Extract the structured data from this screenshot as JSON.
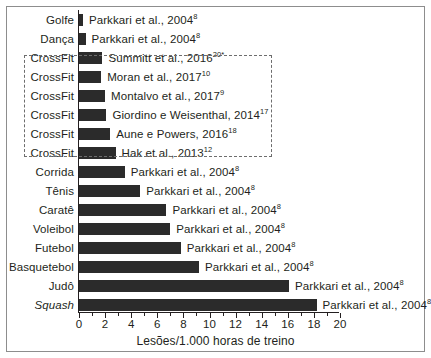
{
  "chart_data": {
    "type": "bar",
    "orientation": "horizontal",
    "title": "",
    "xlabel": "Lesões/1.000 horas de treino",
    "ylabel": "",
    "xlim": [
      0,
      20
    ],
    "xticks": [
      0,
      2,
      4,
      6,
      8,
      10,
      12,
      14,
      16,
      18,
      20
    ],
    "xtick_labels": [
      "0",
      "2",
      "4",
      "6",
      "8",
      "10",
      "12",
      "14",
      "16",
      "18",
      "20"
    ],
    "minor_tick_step": 1,
    "grid": false,
    "legend": null,
    "bar_color": "#2b2b2b",
    "categories": [
      "Golfe",
      "Dança",
      "CrossFit",
      "CrossFit",
      "CrossFit",
      "CrossFit",
      "CrossFit",
      "CrossFit",
      "Corrida",
      "Tênis",
      "Caratê",
      "Voleibol",
      "Futebol",
      "Basquetebol",
      "Judô",
      "Squash"
    ],
    "values": [
      0.3,
      0.5,
      1.8,
      1.7,
      2.0,
      2.1,
      2.4,
      2.8,
      3.5,
      4.7,
      6.7,
      7.0,
      7.8,
      9.2,
      16.1,
      18.2
    ],
    "annotations": [
      "Parkkari et al., 2004",
      "Parkkari et al., 2004",
      "Summitt et al., 2016",
      "Moran et al., 2017",
      "Montalvo et al., 2017",
      "Giordino e Weisenthal, 2014",
      "Aune e Powers, 2016",
      "Hak et al., 2013",
      "Parkkari et al., 2004",
      "Parkkari et al., 2004",
      "Parkkari et al., 2004",
      "Parkkari et al., 2004",
      "Parkkari et al., 2004",
      "Parkkari et al., 2004",
      "Parkkari et al., 2004",
      "Parkkari et al., 2004"
    ],
    "annotation_refs": [
      "8",
      "8",
      "20*",
      "10",
      "9",
      "17",
      "18",
      "12",
      "8",
      "8",
      "8",
      "8",
      "8",
      "8",
      "8",
      "8"
    ]
  },
  "rows": [
    {
      "category": "Golfe",
      "italic": false,
      "value": 0.3,
      "source": "Parkkari et al., 2004",
      "ref": "8",
      "highlighted": false
    },
    {
      "category": "Dança",
      "italic": false,
      "value": 0.5,
      "source": "Parkkari et al., 2004",
      "ref": "8",
      "highlighted": false
    },
    {
      "category": "CrossFit",
      "italic": false,
      "value": 1.8,
      "source": "Summitt et al., 2016",
      "ref": "20*",
      "highlighted": true
    },
    {
      "category": "CrossFit",
      "italic": false,
      "value": 1.7,
      "source": "Moran et al., 2017",
      "ref": "10",
      "highlighted": true
    },
    {
      "category": "CrossFit",
      "italic": false,
      "value": 2.0,
      "source": "Montalvo et al., 2017",
      "ref": "9",
      "highlighted": true
    },
    {
      "category": "CrossFit",
      "italic": false,
      "value": 2.1,
      "source": "Giordino e Weisenthal, 2014",
      "ref": "17",
      "highlighted": true
    },
    {
      "category": "CrossFit",
      "italic": false,
      "value": 2.4,
      "source": "Aune e Powers, 2016",
      "ref": "18",
      "highlighted": true
    },
    {
      "category": "CrossFit",
      "italic": false,
      "value": 2.8,
      "source": "Hak et al., 2013",
      "ref": "12",
      "highlighted": true
    },
    {
      "category": "Corrida",
      "italic": false,
      "value": 3.5,
      "source": "Parkkari et al., 2004",
      "ref": "8",
      "highlighted": false
    },
    {
      "category": "Tênis",
      "italic": false,
      "value": 4.7,
      "source": "Parkkari et al., 2004",
      "ref": "8",
      "highlighted": false
    },
    {
      "category": "Caratê",
      "italic": false,
      "value": 6.7,
      "source": "Parkkari et al., 2004",
      "ref": "8",
      "highlighted": false
    },
    {
      "category": "Voleibol",
      "italic": false,
      "value": 7.0,
      "source": "Parkkari et al., 2004",
      "ref": "8",
      "highlighted": false
    },
    {
      "category": "Futebol",
      "italic": false,
      "value": 7.8,
      "source": "Parkkari et al., 2004",
      "ref": "8",
      "highlighted": false
    },
    {
      "category": "Basquetebol",
      "italic": false,
      "value": 9.2,
      "source": "Parkkari et al., 2004",
      "ref": "8",
      "highlighted": false
    },
    {
      "category": "Judô",
      "italic": false,
      "value": 16.1,
      "source": "Parkkari et al., 2004",
      "ref": "8",
      "highlighted": false
    },
    {
      "category": "Squash",
      "italic": true,
      "value": 18.2,
      "source": "Parkkari et al., 2004",
      "ref": "8",
      "highlighted": false
    }
  ],
  "axis": {
    "title": "Lesões/1.000 horas de treino",
    "ticks": [
      "0",
      "2",
      "4",
      "6",
      "8",
      "10",
      "12",
      "14",
      "16",
      "18",
      "20"
    ]
  },
  "colors": {
    "bar": "#2b2b2b",
    "text": "#231f20",
    "frame": "#8d8d8d",
    "highlight_border": "#6d6d6d"
  }
}
